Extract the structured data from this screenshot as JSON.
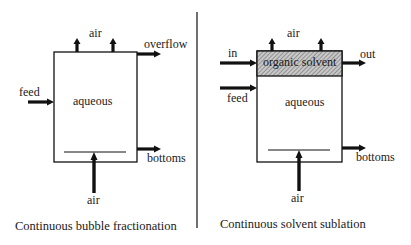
{
  "left_panel": {
    "caption": "Continuous bubble fractionation",
    "labels": {
      "air_top": "air",
      "overflow": "overflow",
      "feed": "feed",
      "aqueous": "aqueous",
      "bottoms": "bottoms",
      "air_bottom": "air"
    }
  },
  "right_panel": {
    "caption": "Continuous solvent sublation",
    "labels": {
      "air_top": "air",
      "in": "in",
      "out": "out",
      "organic_solvent": "organic solvent",
      "feed": "feed",
      "aqueous": "aqueous",
      "bottoms": "bottoms",
      "air_bottom": "air"
    }
  },
  "colors": {
    "line": "#111111",
    "hatch": "#9a9a9a",
    "background": "#ffffff"
  }
}
